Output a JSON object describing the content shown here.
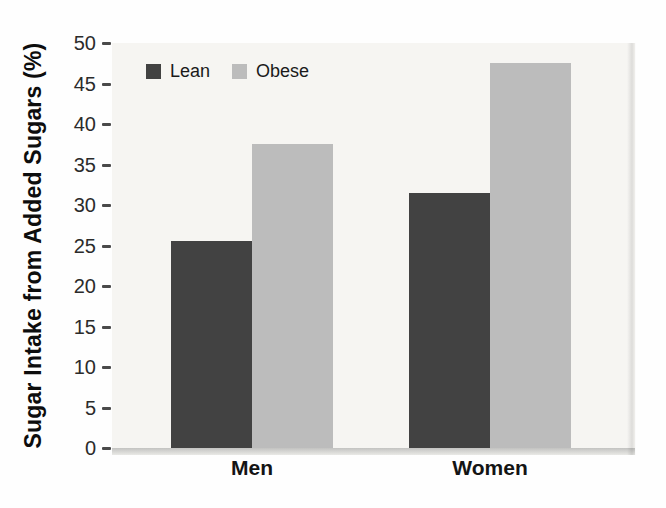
{
  "chart_data": {
    "type": "bar",
    "categories": [
      "Men",
      "Women"
    ],
    "series": [
      {
        "name": "Lean",
        "values": [
          25.5,
          31.5
        ],
        "color": "#424242"
      },
      {
        "name": "Obese",
        "values": [
          37.5,
          47.5
        ],
        "color": "#bcbcbc"
      }
    ],
    "title": "",
    "xlabel": "",
    "ylabel": "Sugar Intake from Added Sugars (%)",
    "ylim": [
      0,
      50
    ],
    "yticks": [
      0,
      5,
      10,
      15,
      20,
      25,
      30,
      35,
      40,
      45,
      50
    ],
    "ytick_step": 5,
    "grid": false,
    "legend_position": "top-left-inside",
    "plot_background": "#f6f5f2",
    "bar_colors": {
      "lean": "#424242",
      "obese": "#bcbcbc"
    }
  },
  "y_axis": {
    "title": "Sugar Intake from Added Sugars (%)",
    "tick_labels": [
      "0",
      "5",
      "10",
      "15",
      "20",
      "25",
      "30",
      "35",
      "40",
      "45",
      "50"
    ]
  },
  "x_axis": {
    "labels": [
      "Men",
      "Women"
    ]
  },
  "legend": {
    "items": [
      {
        "label": "Lean",
        "color": "#424242"
      },
      {
        "label": "Obese",
        "color": "#bcbcbc"
      }
    ]
  }
}
